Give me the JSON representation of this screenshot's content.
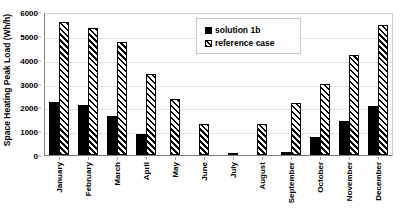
{
  "chart_data": {
    "type": "bar",
    "title": "",
    "xlabel": "",
    "ylabel": "Space Heating Peak Load (Wh/h)",
    "ylim": [
      0,
      6000
    ],
    "ytick_step": 1000,
    "yticks": [
      "0",
      "1000",
      "2000",
      "3000",
      "4000",
      "5000",
      "6000"
    ],
    "grid": true,
    "legend_position": "top-center",
    "categories": [
      "January",
      "February",
      "March",
      "April",
      "May",
      "June",
      "July",
      "August",
      "September",
      "October",
      "November",
      "December"
    ],
    "series": [
      {
        "name": "solution 1b",
        "color": "#000000",
        "pattern": "solid",
        "values": [
          2230,
          2110,
          1620,
          880,
          0,
          0,
          0,
          0,
          130,
          770,
          1430,
          2050
        ]
      },
      {
        "name": "reference case",
        "color": "#000000",
        "pattern": "diagonal-hatch",
        "values": [
          5580,
          5350,
          4740,
          3420,
          2360,
          1300,
          60,
          1290,
          2170,
          2970,
          4210,
          5440
        ]
      }
    ]
  },
  "legend": {
    "items": [
      {
        "label": "solution 1b",
        "swatch": "solid-square-icon"
      },
      {
        "label": "reference case",
        "swatch": "hatched-square-icon"
      }
    ]
  }
}
